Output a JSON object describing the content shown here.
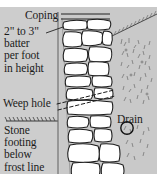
{
  "figure": {
    "background_color": "#c9c9c9",
    "paper_color": "#ffffff",
    "ink_color": "#1b1b1b",
    "stone_fill": "#ffffff"
  },
  "labels": {
    "coping": "Coping",
    "batter_line1": "2\" to 3\"",
    "batter_line2": "batter",
    "batter_line3": "per foot",
    "batter_line4": "in height",
    "weep_hole": "Weep hole",
    "footing_line1": "Stone",
    "footing_line2": "footing",
    "footing_line3": "below",
    "footing_line4": "frost line",
    "drain": "Drain"
  },
  "callouts": [
    {
      "name": "coping-leader",
      "target": "top capstone course"
    },
    {
      "name": "batter-arrow",
      "target": "wall face batter"
    },
    {
      "name": "weep-hole-dashes",
      "target": "weep hole through wall"
    },
    {
      "name": "drain-circle",
      "target": "perforated drain pipe"
    }
  ],
  "elements": {
    "grade_line": "hatched finished grade line",
    "batter_reference": "vertical plumb reference line",
    "backfill": "gravel backfill sketch texture",
    "slope": "sloping grade behind wall"
  }
}
